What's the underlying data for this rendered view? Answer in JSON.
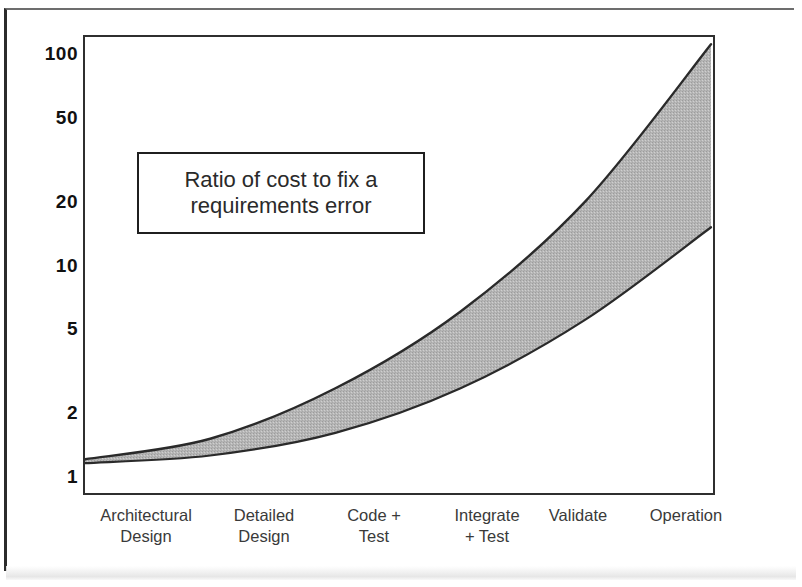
{
  "chart_data": {
    "type": "area",
    "title": "",
    "annotation": "Ratio of cost to fix a\nrequirements error",
    "xlabel": "",
    "ylabel": "",
    "yscale": "log",
    "ylim": [
      1,
      120
    ],
    "grid": false,
    "legend": "none",
    "categories": [
      "Architectural\nDesign",
      "Detailed\nDesign",
      "Code +\nTest",
      "Integrate\n+ Test",
      "Validate",
      "Operation"
    ],
    "y_tick_labels": [
      "100",
      "50",
      "20",
      "10",
      "5",
      "2",
      "1"
    ],
    "y_tick_values": [
      100,
      50,
      20,
      10,
      5,
      2,
      1
    ],
    "series": [
      {
        "name": "Upper bound (cost-to-fix ratio)",
        "values": [
          1.2,
          1.5,
          2.6,
          6.0,
          20.0,
          110.0
        ]
      },
      {
        "name": "Lower bound (cost-to-fix ratio)",
        "values": [
          1.15,
          1.25,
          1.6,
          2.6,
          5.5,
          15.0
        ]
      }
    ],
    "band_fill_color": "#b6b6b6",
    "curve_color": "#2a2a2a",
    "axis_color": "#2f2f2f"
  },
  "y_axis": {
    "ticks": [
      {
        "label": "100",
        "value": 100
      },
      {
        "label": "50",
        "value": 50
      },
      {
        "label": "20",
        "value": 20
      },
      {
        "label": "10",
        "value": 10
      },
      {
        "label": "5",
        "value": 5
      },
      {
        "label": "2",
        "value": 2
      },
      {
        "label": "1",
        "value": 1
      }
    ]
  },
  "x_axis": {
    "ticks": [
      {
        "label": "Architectural\nDesign"
      },
      {
        "label": "Detailed\nDesign"
      },
      {
        "label": "Code +\nTest"
      },
      {
        "label": "Integrate\n+ Test"
      },
      {
        "label": "Validate"
      },
      {
        "label": "Operation"
      }
    ]
  },
  "annotation": {
    "text": "Ratio of cost to fix a\nrequirements error"
  }
}
